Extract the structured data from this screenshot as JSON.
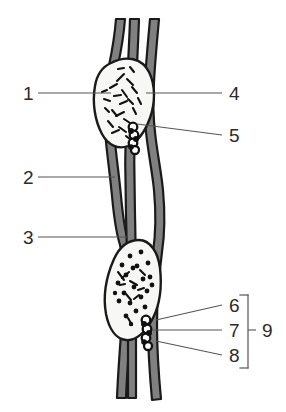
{
  "figure": {
    "background_color": "#ffffff",
    "vessel_fill_color": "#808080",
    "vessel_outline_color": "#1a1a1a",
    "node_fill_color": "#f7f7f5",
    "node_outline_color": "#1a1a1a",
    "valve_bead_color": "#111111",
    "leader_line_color": "#555555",
    "label_text_color": "#2b2b2b"
  },
  "labels": [
    {
      "id": "1",
      "text": "1",
      "side": "left",
      "x": 23,
      "y": 99,
      "line_from_x": 38,
      "line_from_y": 93,
      "line_to_x": 111,
      "line_to_y": 93
    },
    {
      "id": "2",
      "text": "2",
      "side": "left",
      "x": 23,
      "y": 183,
      "line_from_x": 38,
      "line_from_y": 177,
      "line_to_x": 115,
      "line_to_y": 177
    },
    {
      "id": "3",
      "text": "3",
      "side": "left",
      "x": 23,
      "y": 243,
      "line_from_x": 38,
      "line_from_y": 237,
      "line_to_x": 127,
      "line_to_y": 237
    },
    {
      "id": "4",
      "text": "4",
      "side": "right",
      "x": 228,
      "y": 99,
      "line_from_x": 222,
      "line_from_y": 93,
      "line_to_x": 145,
      "line_to_y": 93
    },
    {
      "id": "5",
      "text": "5",
      "side": "right",
      "x": 228,
      "y": 141,
      "line_from_x": 222,
      "line_from_y": 135,
      "line_to_x": 137,
      "line_to_y": 125
    },
    {
      "id": "6",
      "text": "6",
      "side": "right",
      "x": 228,
      "y": 311,
      "line_from_x": 222,
      "line_from_y": 305,
      "line_to_x": 157,
      "line_to_y": 319
    },
    {
      "id": "7",
      "text": "7",
      "side": "right",
      "x": 228,
      "y": 336,
      "line_from_x": 222,
      "line_from_y": 330,
      "line_to_x": 152,
      "line_to_y": 330
    },
    {
      "id": "8",
      "text": "8",
      "side": "right",
      "x": 228,
      "y": 361,
      "line_from_x": 222,
      "line_from_y": 355,
      "line_to_x": 157,
      "line_to_y": 341
    },
    {
      "id": "9",
      "text": "9",
      "side": "right",
      "x": 262,
      "y": 336,
      "line_from_x": 256,
      "line_from_y": 330,
      "line_to_x": 248,
      "line_to_y": 330
    }
  ],
  "bracket": {
    "name": "group-bracket-9",
    "groups": [
      "6",
      "7",
      "8"
    ],
    "grouped_by": "9",
    "x": 248,
    "top_y": 295,
    "bottom_y": 368,
    "tick_len": 8
  },
  "structures": [
    {
      "name": "upper-lymph-node",
      "label_ref": "1",
      "marking_style": "dashes"
    },
    {
      "name": "lower-lymph-node",
      "label_ref": "3",
      "marking_style": "dots"
    },
    {
      "name": "left-lymphatic-vessel",
      "label_ref": "2"
    },
    {
      "name": "right-lymphatic-vessel",
      "label_ref": "4"
    },
    {
      "name": "upper-valve-bead-cluster",
      "label_ref": "5",
      "bead_count": 4
    },
    {
      "name": "lower-valve-bead-cluster",
      "label_ref": "7",
      "bead_count": 4
    }
  ],
  "node_markings": {
    "upper_dashes": [
      [
        122,
        78,
        14,
        -40
      ],
      [
        130,
        83,
        12,
        20
      ],
      [
        114,
        86,
        10,
        -25
      ],
      [
        126,
        92,
        13,
        60
      ],
      [
        118,
        95,
        9,
        10
      ],
      [
        134,
        88,
        11,
        -55
      ],
      [
        110,
        99,
        8,
        35
      ],
      [
        124,
        103,
        12,
        -15
      ],
      [
        116,
        108,
        10,
        50
      ],
      [
        131,
        100,
        9,
        25
      ],
      [
        120,
        114,
        13,
        -35
      ],
      [
        127,
        118,
        10,
        15
      ],
      [
        113,
        120,
        9,
        -50
      ],
      [
        123,
        125,
        12,
        40
      ],
      [
        116,
        131,
        11,
        -20
      ],
      [
        128,
        110,
        8,
        70
      ],
      [
        106,
        93,
        7,
        -30
      ],
      [
        135,
        96,
        8,
        45
      ],
      [
        121,
        70,
        9,
        5
      ],
      [
        118,
        66,
        7,
        -60
      ]
    ],
    "lower_dots": [
      [
        130,
        256,
        3
      ],
      [
        140,
        252,
        3
      ],
      [
        122,
        262,
        3
      ],
      [
        136,
        266,
        3
      ],
      [
        148,
        262,
        3
      ],
      [
        126,
        274,
        3
      ],
      [
        142,
        278,
        3
      ],
      [
        118,
        280,
        3
      ],
      [
        134,
        286,
        3
      ],
      [
        150,
        276,
        3
      ],
      [
        124,
        292,
        3
      ],
      [
        140,
        296,
        3
      ],
      [
        130,
        302,
        3
      ],
      [
        146,
        290,
        3
      ],
      [
        120,
        300,
        3
      ],
      [
        136,
        310,
        3
      ],
      [
        126,
        314,
        3
      ],
      [
        144,
        306,
        3
      ],
      [
        132,
        268,
        3
      ],
      [
        152,
        284,
        3
      ]
    ],
    "lower_dashes": [
      [
        126,
        276,
        13,
        -45
      ],
      [
        133,
        282,
        12,
        30
      ],
      [
        140,
        290,
        11,
        -20
      ],
      [
        129,
        296,
        10,
        55
      ],
      [
        136,
        300,
        9,
        -35
      ],
      [
        123,
        286,
        8,
        15
      ],
      [
        131,
        320,
        10,
        -70
      ],
      [
        142,
        272,
        9,
        60
      ]
    ]
  }
}
